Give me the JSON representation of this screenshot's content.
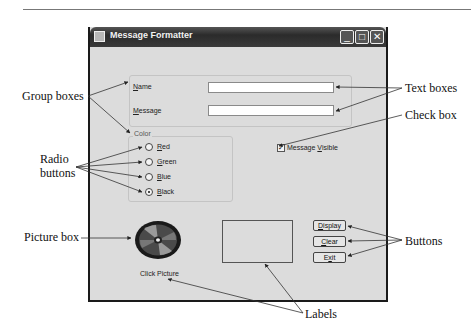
{
  "window": {
    "title": "Message Formatter",
    "controls": {
      "minimize": "_",
      "maximize": "□",
      "close": "✕"
    }
  },
  "form": {
    "name_label": "Name",
    "name_accel": "N",
    "name_value": "",
    "message_label": "Message",
    "message_accel": "M",
    "message_value": "",
    "color_group_label": "Color",
    "radios": [
      {
        "label": "Red",
        "accel": "R",
        "checked": false
      },
      {
        "label": "Green",
        "accel": "G",
        "checked": false
      },
      {
        "label": "Blue",
        "accel": "B",
        "checked": false
      },
      {
        "label": "Black",
        "accel": "B",
        "checked": true
      }
    ],
    "checkbox": {
      "label": "Message Visible",
      "accel": "V",
      "checked": true
    },
    "picture_caption": "Click Picture",
    "buttons": [
      {
        "label": "Display",
        "accel": "D"
      },
      {
        "label": "Clear",
        "accel": "C"
      },
      {
        "label": "Exit",
        "accel": "x"
      }
    ]
  },
  "callouts": {
    "group_boxes": "Group boxes",
    "radio_buttons_1": "Radio",
    "radio_buttons_2": "buttons",
    "picture_box": "Picture box",
    "text_boxes": "Text boxes",
    "check_box": "Check box",
    "buttons": "Buttons",
    "labels": "Labels"
  }
}
